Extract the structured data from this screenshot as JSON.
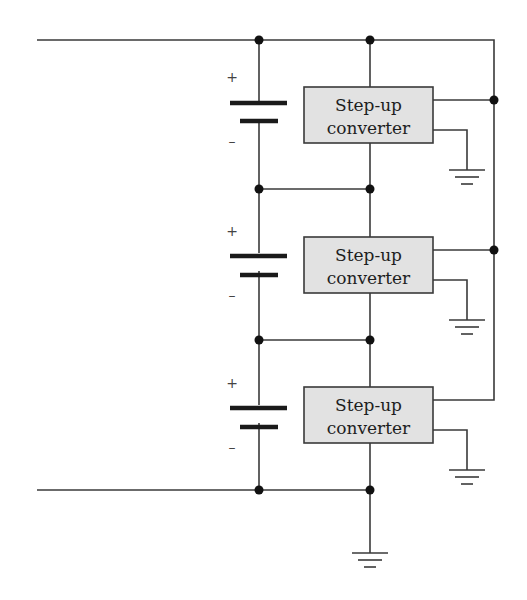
{
  "diagram": {
    "type": "circuit-schematic",
    "colors": {
      "wire": "#3a3a3a",
      "box_fill": "#e2e2e2",
      "node": "#111111"
    },
    "converters": [
      {
        "id": "converter-1",
        "line1": "Step-up",
        "line2": "converter"
      },
      {
        "id": "converter-2",
        "line1": "Step-up",
        "line2": "converter"
      },
      {
        "id": "converter-3",
        "line1": "Step-up",
        "line2": "converter"
      }
    ],
    "batteries": [
      {
        "id": "battery-1",
        "plus": "+",
        "minus": "–"
      },
      {
        "id": "battery-2",
        "plus": "+",
        "minus": "–"
      },
      {
        "id": "battery-3",
        "plus": "+",
        "minus": "–"
      }
    ],
    "grounds": 4
  }
}
